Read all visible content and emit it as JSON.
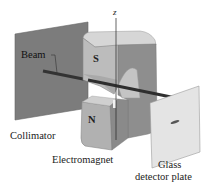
{
  "figure": {
    "axis_label": "z",
    "labels": {
      "beam": "Beam",
      "collimator": "Collimator",
      "electromagnet": "Electromagnet",
      "detector_line1": "Glass",
      "detector_line2": "detector plate"
    },
    "pole_labels": {
      "north": "N",
      "south": "S"
    },
    "colors": {
      "collimator_plate": "#7a7a7a",
      "magnet_face": "#b9b9b9",
      "magnet_side": "#8c8c8c",
      "magnet_top": "#d4d4d4",
      "beam": "#3a3a3a",
      "detector_plate": "#e3e3e3",
      "detector_spot": "#555555"
    }
  }
}
